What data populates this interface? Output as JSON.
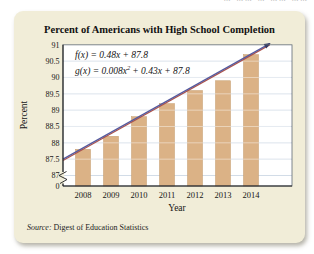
{
  "page": {
    "artifact_text": "m mm m mm mm"
  },
  "card": {
    "title": "Percent of Americans with High School Completion",
    "source_label": "Source:",
    "source_text": " Digest of Education Statistics"
  },
  "formulas": {
    "f_text": "f(x) = 0.48x + 87.8",
    "f_color": "#b3564e",
    "g_prefix": "g(x) = 0.008x",
    "g_sup": "2",
    "g_suffix": "+ 0.43x + 87.8",
    "g_color": "#4d5fa6"
  },
  "chart_data": {
    "type": "bar",
    "title": "Percent of Americans with High School Completion",
    "xlabel": "Year",
    "ylabel": "Percent",
    "categories": [
      "2008",
      "2009",
      "2010",
      "2011",
      "2012",
      "2013",
      "2014"
    ],
    "values": [
      87.8,
      88.2,
      88.8,
      89.2,
      89.6,
      89.9,
      90.7
    ],
    "ylim": [
      87,
      91
    ],
    "ytick_step": 0.5,
    "ytick_labels": [
      "91",
      "90.5",
      "90",
      "89.5",
      "89",
      "88.5",
      "88",
      "87.5",
      "87"
    ],
    "origin_label": "0",
    "axis_break": true,
    "grid": true,
    "bar_color": "#dbb286",
    "bar_edge_color": "#c39a6a",
    "grid_color": "#c6d3e1",
    "model_lines": [
      {
        "name": "f",
        "type": "linear",
        "slope": 0.48,
        "intercept": 87.8,
        "color": "#ae544b"
      },
      {
        "name": "g",
        "type": "quadratic",
        "a": 0.008,
        "b": 0.43,
        "c": 87.8,
        "color": "#555a9e"
      }
    ],
    "arrow_color": "#2f3763"
  }
}
